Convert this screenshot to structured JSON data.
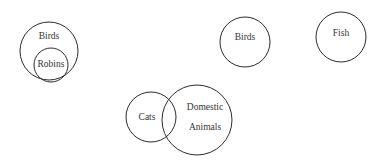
{
  "diagram": {
    "type": "euler-set-diagram",
    "background_color": "#ffffff",
    "stroke_color": "#2b2b2b",
    "text_color": "#333333",
    "width": 382,
    "height": 162,
    "groups": [
      {
        "name": "birds-robins-nested",
        "relation": "subset",
        "sets": [
          {
            "label": "Birds",
            "role": "outer",
            "cx": 49,
            "cy": 51,
            "r": 29,
            "label_x": 49,
            "label_y": 37
          },
          {
            "label": "Robins",
            "role": "inner",
            "cx": 51,
            "cy": 65,
            "r": 17,
            "label_x": 51,
            "label_y": 65
          }
        ]
      },
      {
        "name": "birds-standalone",
        "relation": "disjoint",
        "sets": [
          {
            "label": "Birds",
            "role": "single",
            "cx": 245,
            "cy": 42,
            "r": 25,
            "label_x": 245,
            "label_y": 38
          }
        ]
      },
      {
        "name": "fish-standalone",
        "relation": "disjoint",
        "sets": [
          {
            "label": "Fish",
            "role": "single",
            "cx": 341,
            "cy": 37,
            "r": 25,
            "label_x": 341,
            "label_y": 34
          }
        ]
      },
      {
        "name": "cats-domestic-animals-overlap",
        "relation": "intersect",
        "sets": [
          {
            "label": "Cats",
            "role": "left",
            "cx": 151,
            "cy": 117,
            "r": 25,
            "label_x": 147,
            "label_y": 118
          },
          {
            "label": "Domestic Animals",
            "label_line_1": "Domestic",
            "label_line_2": "Animals",
            "role": "right",
            "cx": 197,
            "cy": 120,
            "r": 35,
            "label_x": 205,
            "label_y": 108,
            "label_y_2": 128
          }
        ]
      }
    ]
  }
}
